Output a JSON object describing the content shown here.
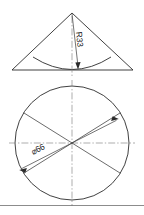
{
  "sheet": {
    "title": "Engineering drawing - conical part",
    "background_color": "#ffffff",
    "line_color": "#2b2b2b",
    "centerline_color": "#8a8a8a"
  },
  "views": {
    "elevation": {
      "name": "front-elevation-cone",
      "shape": "triangle-with-concave-arc",
      "apex": {
        "x": 72,
        "y": 13
      },
      "base_left": {
        "x": 12,
        "y": 70
      },
      "base_right": {
        "x": 133,
        "y": 70
      },
      "arc_left": {
        "x": 33,
        "y": 57
      },
      "arc_right": {
        "x": 111,
        "y": 57
      },
      "arc_bottom": {
        "x": 72,
        "y": 70
      },
      "radius_dimension": {
        "label": "R33",
        "value": 33,
        "prefix": "R",
        "leader_start": {
          "x": 72,
          "y": 14
        },
        "leader_end": {
          "x": 78,
          "y": 68
        },
        "text_rotation_deg": 84
      }
    },
    "plan": {
      "name": "top-plan-circle",
      "shape": "circle-with-four-spokes",
      "center": {
        "x": 72,
        "y": 143
      },
      "radius": 57,
      "spoke_angles_deg": [
        32,
        148,
        212,
        328
      ],
      "diameter_dimension": {
        "label": "⌀66",
        "symbol": "⌀",
        "value": 66,
        "angle_deg": 27,
        "arrow_start": {
          "x": 21,
          "y": 169
        },
        "arrow_end": {
          "x": 117,
          "y": 120
        },
        "text_rotation_deg": -27
      }
    }
  },
  "border": {
    "name": "sheet-border-bottom",
    "y": 205,
    "x_start": 0,
    "x_end": 144
  }
}
